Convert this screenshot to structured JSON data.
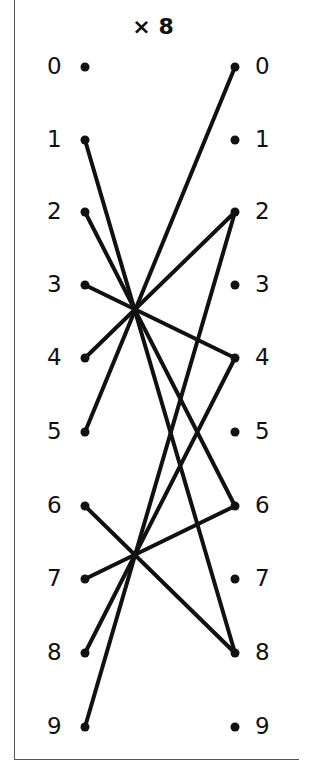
{
  "title": "× 8",
  "multiplier": 8,
  "left_column": {
    "labels": [
      "0",
      "1",
      "2",
      "3",
      "4",
      "5",
      "6",
      "7",
      "8",
      "9"
    ]
  },
  "right_column": {
    "labels": [
      "0",
      "1",
      "2",
      "3",
      "4",
      "5",
      "6",
      "7",
      "8",
      "9"
    ]
  },
  "connections": [
    {
      "from": 1,
      "to": 8
    },
    {
      "from": 2,
      "to": 6
    },
    {
      "from": 3,
      "to": 4
    },
    {
      "from": 4,
      "to": 2
    },
    {
      "from": 5,
      "to": 0
    },
    {
      "from": 6,
      "to": 8
    },
    {
      "from": 7,
      "to": 6
    },
    {
      "from": 8,
      "to": 4
    },
    {
      "from": 9,
      "to": 2
    }
  ],
  "colors": {
    "line": "#111111",
    "dot": "#111111",
    "frame": "#555555"
  }
}
